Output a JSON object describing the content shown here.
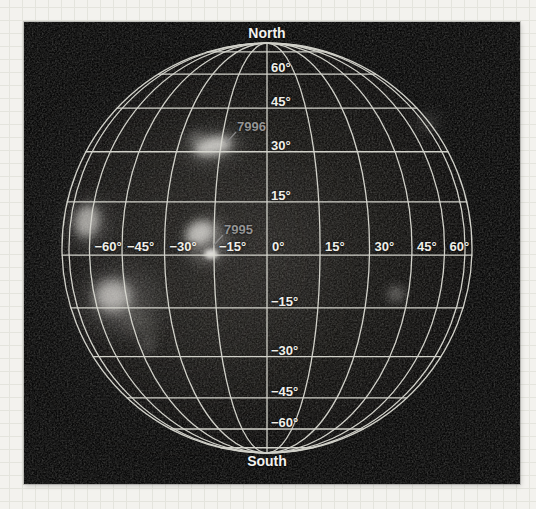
{
  "colors": {
    "paper_bg": "#f3f2ee",
    "paper_grid": "#e4e4dd",
    "photo_bg": "#0a0a0a",
    "grid_line": "#dbdbd3",
    "grid_label": "#f0efe9",
    "pole_label": "#f2f2ef",
    "region_label": "#949494",
    "pointer_line": "#8a8a8a"
  },
  "solar_map": {
    "type": "heliographic-orthographic-grid",
    "geometry": {
      "cx": 243,
      "cy": 226,
      "radius": 205,
      "tilt_deg": 2,
      "grid_step_deg": 15
    },
    "pole_labels": {
      "north": "North",
      "south": "South"
    },
    "latitude_labels": [
      {
        "deg": 60,
        "text": "60°"
      },
      {
        "deg": 45,
        "text": "45°"
      },
      {
        "deg": 30,
        "text": "30°"
      },
      {
        "deg": 15,
        "text": "15°"
      },
      {
        "deg": -15,
        "text": "−15°"
      },
      {
        "deg": -30,
        "text": "−30°"
      },
      {
        "deg": -45,
        "text": "−45°"
      },
      {
        "deg": -60,
        "text": "−60°"
      }
    ],
    "longitude_labels": [
      {
        "deg": -60,
        "text": "−60°"
      },
      {
        "deg": -45,
        "text": "−45°"
      },
      {
        "deg": -30,
        "text": "−30°"
      },
      {
        "deg": -15,
        "text": "−15°"
      },
      {
        "deg": 0,
        "text": "0°"
      },
      {
        "deg": 15,
        "text": "15°"
      },
      {
        "deg": 30,
        "text": "30°"
      },
      {
        "deg": 45,
        "text": "45°"
      },
      {
        "deg": 60,
        "text": "60°"
      }
    ],
    "active_regions": [
      {
        "id": "7996",
        "label_x": 213,
        "label_y": 104,
        "line": [
          212,
          110,
          202,
          121
        ]
      },
      {
        "id": "7995",
        "label_x": 200,
        "label_y": 207,
        "line": [
          199,
          213,
          190,
          223
        ]
      }
    ],
    "features": [
      {
        "name": "haze-left-hemisphere",
        "cx": 150,
        "cy": 235,
        "rx": 115,
        "ry": 140,
        "rot": 0,
        "fill": "#3c3a38",
        "opacity": 0.22,
        "blur": 40
      },
      {
        "name": "ar7996-halo",
        "cx": 189,
        "cy": 125,
        "rx": 30,
        "ry": 16,
        "rot": -12,
        "fill": "#9a9a96",
        "opacity": 0.3,
        "blur": 9
      },
      {
        "name": "ar7996-core",
        "cx": 189,
        "cy": 124,
        "rx": 19,
        "ry": 9,
        "rot": -12,
        "fill": "#d6d4d0",
        "opacity": 0.85,
        "blur": 4
      },
      {
        "name": "ar7996-spur",
        "cx": 172,
        "cy": 116,
        "rx": 9,
        "ry": 6,
        "rot": -20,
        "fill": "#a8a8a4",
        "opacity": 0.4,
        "blur": 5
      },
      {
        "name": "ar7995-halo",
        "cx": 183,
        "cy": 219,
        "rx": 21,
        "ry": 23,
        "rot": 0,
        "fill": "#8f8d8a",
        "opacity": 0.5,
        "blur": 7
      },
      {
        "name": "ar7995-crescent",
        "cx": 176,
        "cy": 211,
        "rx": 14,
        "ry": 11,
        "rot": -25,
        "fill": "#d2d0cc",
        "opacity": 0.8,
        "blur": 4
      },
      {
        "name": "ar7995-bright-spot",
        "cx": 187,
        "cy": 232,
        "rx": 7,
        "ry": 5,
        "rot": 0,
        "fill": "#eceae6",
        "opacity": 0.9,
        "blur": 2
      },
      {
        "name": "east-limb-plage-halo",
        "cx": 66,
        "cy": 202,
        "rx": 20,
        "ry": 26,
        "rot": 10,
        "fill": "#8a8886",
        "opacity": 0.3,
        "blur": 10
      },
      {
        "name": "east-limb-plage",
        "cx": 63,
        "cy": 199,
        "rx": 12,
        "ry": 16,
        "rot": 10,
        "fill": "#c4c2be",
        "opacity": 0.75,
        "blur": 5
      },
      {
        "name": "southeast-region-halo",
        "cx": 95,
        "cy": 278,
        "rx": 38,
        "ry": 30,
        "rot": 0,
        "fill": "#8a8886",
        "opacity": 0.32,
        "blur": 13
      },
      {
        "name": "southeast-region-core",
        "cx": 89,
        "cy": 274,
        "rx": 18,
        "ry": 16,
        "rot": 0,
        "fill": "#cac8c4",
        "opacity": 0.8,
        "blur": 6
      },
      {
        "name": "southeast-plume",
        "cx": 113,
        "cy": 300,
        "rx": 24,
        "ry": 11,
        "rot": 35,
        "fill": "#96948f",
        "opacity": 0.28,
        "blur": 9
      },
      {
        "name": "southeast-faint-spot",
        "cx": 124,
        "cy": 323,
        "rx": 7,
        "ry": 9,
        "rot": 0,
        "fill": "#8b8986",
        "opacity": 0.3,
        "blur": 5
      },
      {
        "name": "west-faint-spot",
        "cx": 372,
        "cy": 272,
        "rx": 9,
        "ry": 8,
        "rot": 0,
        "fill": "#9a9894",
        "opacity": 0.5,
        "blur": 5
      },
      {
        "name": "northwest-faint-glow",
        "cx": 404,
        "cy": 100,
        "rx": 11,
        "ry": 9,
        "rot": 0,
        "fill": "#787672",
        "opacity": 0.3,
        "blur": 7
      }
    ]
  }
}
